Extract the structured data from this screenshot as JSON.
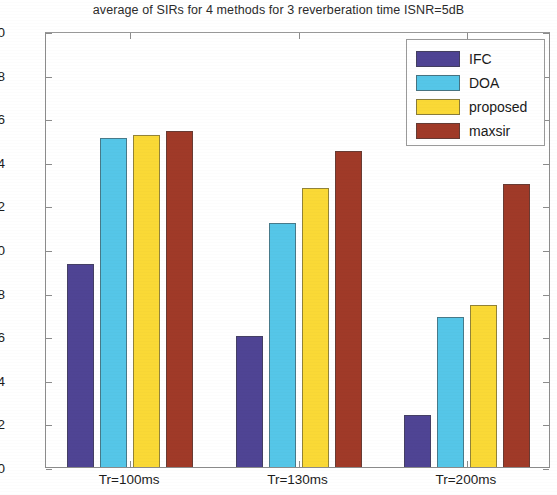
{
  "chart_data": {
    "type": "bar",
    "title": "average of SIRs for 4 methods for 3 reverberation time ISNR=5dB",
    "xlabel": "",
    "ylabel": "",
    "categories": [
      "Tr=100ms",
      "Tr=130ms",
      "Tr=200ms"
    ],
    "series": [
      {
        "name": "IFC",
        "color": "#4F4494",
        "values": [
          9.3,
          6.0,
          2.4
        ]
      },
      {
        "name": "DOA",
        "color": "#55C6E8",
        "values": [
          15.1,
          11.2,
          6.9
        ]
      },
      {
        "name": "proposed",
        "color": "#FAD936",
        "values": [
          15.25,
          12.8,
          7.45
        ]
      },
      {
        "name": "maxsir",
        "color": "#A03A28",
        "values": [
          15.4,
          14.5,
          13.0
        ]
      }
    ],
    "ylim": [
      0,
      20
    ],
    "ytick_step": 2,
    "yticks": [
      "0",
      "2",
      "4",
      "6",
      "8",
      "10",
      "12",
      "14",
      "16",
      "18",
      "20"
    ],
    "grid": false,
    "legend_position": "top-right"
  },
  "legend": {
    "entries": [
      {
        "label": "IFC"
      },
      {
        "label": "DOA"
      },
      {
        "label": "proposed"
      },
      {
        "label": "maxsir"
      }
    ]
  }
}
